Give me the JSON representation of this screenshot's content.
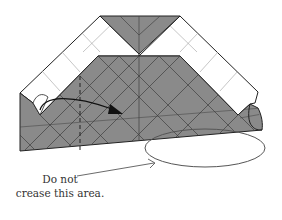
{
  "diagram": {
    "annotation": {
      "line1": "Do not",
      "line2": "crease this area."
    },
    "colors": {
      "paper_colored": "#8a8a8a",
      "paper_white": "#ffffff",
      "outline": "#222222",
      "crease": "#4a4a4a",
      "light_crease": "#9a9a9a",
      "ellipse": "#555555"
    },
    "elements": [
      "gray-top-triangle",
      "white-left-band",
      "white-right-band",
      "gray-main-body",
      "valley-fold-dashed-line",
      "fold-arrow",
      "no-crease-ellipse",
      "pointer-arrow"
    ]
  }
}
